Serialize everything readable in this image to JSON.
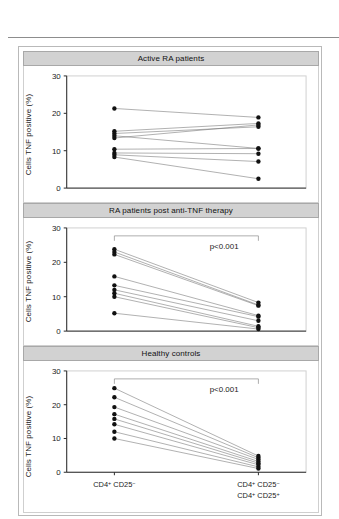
{
  "figure": {
    "y_axis_label": "Cells TNF positive (%)",
    "y_ticks": [
      0,
      10,
      20,
      30
    ],
    "y_limits": [
      0,
      30
    ],
    "x_categories_left": "CD4+ CD25-",
    "x_categories_right_line1": "CD4+ CD25-",
    "x_categories_right_line2": "CD4+ CD25+",
    "x_left_base": "CD4",
    "x_left_sup": "+",
    "x_left_base2": "CD25",
    "x_left_sup2": "−",
    "x_right_l1_base": "CD4",
    "x_right_l1_sup": "+",
    "x_right_l1_base2": "CD25",
    "x_right_l1_sup2": "−",
    "x_right_l2_base": "CD4",
    "x_right_l2_sup": "+",
    "x_right_l2_base2": "CD25",
    "x_right_l2_sup2": "+",
    "panel_titles": [
      "Active RA patients",
      "RA patients post anti-TNF therapy",
      "Healthy controls"
    ],
    "pvalue_label": "p<0.001",
    "colors": {
      "header_band": "#d2d2d2",
      "header_border": "#a8a8a8",
      "dot": "#111111",
      "link": "#6f6f6f",
      "axis": "#2a2a2a",
      "frame": "#b9b9b9"
    }
  },
  "chart_data": [
    {
      "type": "line",
      "title": "Active RA patients",
      "subtitle": "",
      "xlabel": "",
      "ylabel": "Cells TNF positive (%)",
      "categories": [
        "CD4+ CD25-",
        "CD4+ CD25- CD4+ CD25+"
      ],
      "x": [
        0,
        1
      ],
      "ylim": [
        0,
        30
      ],
      "yticks": [
        0,
        10,
        20,
        30
      ],
      "grid": false,
      "legend": "none",
      "annotation": "",
      "series": [
        {
          "name": "subject-1",
          "values": [
            21.3,
            18.9
          ]
        },
        {
          "name": "subject-2",
          "values": [
            15.2,
            17.3
          ]
        },
        {
          "name": "subject-3",
          "values": [
            14.6,
            16.4
          ]
        },
        {
          "name": "subject-4",
          "values": [
            14.0,
            10.6
          ]
        },
        {
          "name": "subject-5",
          "values": [
            13.4,
            16.9
          ]
        },
        {
          "name": "subject-6",
          "values": [
            10.4,
            10.6
          ]
        },
        {
          "name": "subject-7",
          "values": [
            9.4,
            9.2
          ]
        },
        {
          "name": "subject-8",
          "values": [
            8.9,
            7.1
          ]
        },
        {
          "name": "subject-9",
          "values": [
            8.3,
            2.5
          ]
        }
      ]
    },
    {
      "type": "line",
      "title": "RA patients post anti-TNF therapy",
      "subtitle": "",
      "xlabel": "",
      "ylabel": "Cells TNF positive (%)",
      "categories": [
        "CD4+ CD25-",
        "CD4+ CD25- CD4+ CD25+"
      ],
      "x": [
        0,
        1
      ],
      "ylim": [
        0,
        30
      ],
      "yticks": [
        0,
        10,
        20,
        30
      ],
      "grid": false,
      "legend": "none",
      "annotation": "p<0.001",
      "series": [
        {
          "name": "subject-1",
          "values": [
            23.8,
            8.3
          ]
        },
        {
          "name": "subject-2",
          "values": [
            23.0,
            7.6
          ]
        },
        {
          "name": "subject-3",
          "values": [
            22.3,
            7.4
          ]
        },
        {
          "name": "subject-4",
          "values": [
            15.9,
            4.5
          ]
        },
        {
          "name": "subject-5",
          "values": [
            13.3,
            4.2
          ]
        },
        {
          "name": "subject-6",
          "values": [
            12.0,
            3.0
          ]
        },
        {
          "name": "subject-7",
          "values": [
            11.0,
            1.4
          ]
        },
        {
          "name": "subject-8",
          "values": [
            10.0,
            1.0
          ]
        },
        {
          "name": "subject-9",
          "values": [
            5.2,
            0.6
          ]
        }
      ]
    },
    {
      "type": "line",
      "title": "Healthy controls",
      "subtitle": "",
      "xlabel": "",
      "ylabel": "Cells TNF positive (%)",
      "categories": [
        "CD4+ CD25-",
        "CD4+ CD25- CD4+ CD25+"
      ],
      "x": [
        0,
        1
      ],
      "ylim": [
        0,
        30
      ],
      "yticks": [
        0,
        10,
        20,
        30
      ],
      "grid": false,
      "legend": "none",
      "annotation": "p<0.001",
      "series": [
        {
          "name": "subject-1",
          "values": [
            24.9,
            4.8
          ]
        },
        {
          "name": "subject-2",
          "values": [
            22.2,
            4.3
          ]
        },
        {
          "name": "subject-3",
          "values": [
            19.3,
            3.8
          ]
        },
        {
          "name": "subject-4",
          "values": [
            17.2,
            3.2
          ]
        },
        {
          "name": "subject-5",
          "values": [
            15.8,
            2.7
          ]
        },
        {
          "name": "subject-6",
          "values": [
            14.2,
            2.2
          ]
        },
        {
          "name": "subject-7",
          "values": [
            12.0,
            1.6
          ]
        },
        {
          "name": "subject-8",
          "values": [
            10.0,
            1.1
          ]
        }
      ]
    }
  ]
}
